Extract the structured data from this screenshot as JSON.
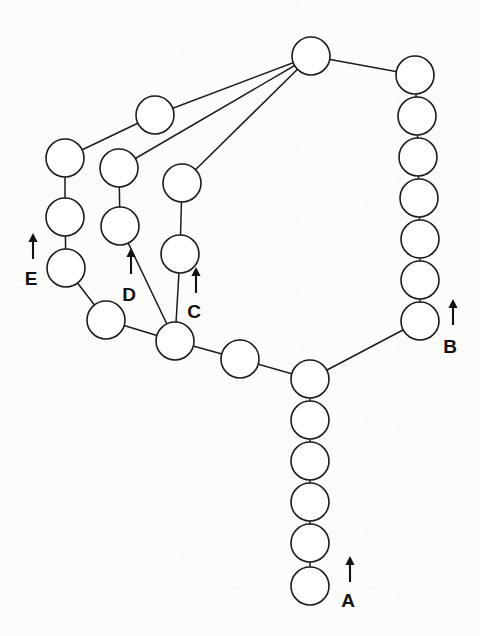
{
  "figure": {
    "canvas": {
      "width": 480,
      "height": 636
    },
    "background_color": "#fcfcfb",
    "stroke_color": "#1b1b1b",
    "node_fill_color": "#ffffff",
    "node_radius": 19
  },
  "nodes": [
    {
      "id": "n1",
      "name": "hub-top",
      "cx": 311,
      "cy": 56
    },
    {
      "id": "n2",
      "name": "right-chain-1",
      "cx": 415,
      "cy": 75
    },
    {
      "id": "n3",
      "name": "right-chain-2",
      "cx": 417,
      "cy": 116
    },
    {
      "id": "n4",
      "name": "right-chain-3",
      "cx": 418,
      "cy": 157
    },
    {
      "id": "n5",
      "name": "right-chain-4",
      "cx": 419,
      "cy": 198
    },
    {
      "id": "n6",
      "name": "right-chain-5",
      "cx": 420,
      "cy": 239
    },
    {
      "id": "n7",
      "name": "right-chain-6",
      "cx": 420,
      "cy": 280
    },
    {
      "id": "n8",
      "name": "right-chain-7-marker-b",
      "cx": 420,
      "cy": 321
    },
    {
      "id": "n9",
      "name": "upper-mid-node",
      "cx": 155,
      "cy": 115
    },
    {
      "id": "n10",
      "name": "e-chain-1",
      "cx": 65,
      "cy": 158
    },
    {
      "id": "n11",
      "name": "e-chain-2",
      "cx": 65,
      "cy": 217
    },
    {
      "id": "n12",
      "name": "e-chain-3-marker-e",
      "cx": 66,
      "cy": 268
    },
    {
      "id": "n13",
      "name": "d-chain-1",
      "cx": 119,
      "cy": 168
    },
    {
      "id": "n14",
      "name": "d-chain-2",
      "cx": 120,
      "cy": 226
    },
    {
      "id": "n15",
      "name": "c-chain-1",
      "cx": 182,
      "cy": 183
    },
    {
      "id": "n16",
      "name": "c-chain-2",
      "cx": 180,
      "cy": 254
    },
    {
      "id": "n17",
      "name": "left-junction",
      "cx": 106,
      "cy": 320
    },
    {
      "id": "n18",
      "name": "mid-junction-marker-cd",
      "cx": 175,
      "cy": 341
    },
    {
      "id": "n19",
      "name": "mid-link-node",
      "cx": 240,
      "cy": 359
    },
    {
      "id": "n20",
      "name": "main-junction",
      "cx": 310,
      "cy": 379
    },
    {
      "id": "n21",
      "name": "a-chain-1",
      "cx": 310,
      "cy": 420
    },
    {
      "id": "n22",
      "name": "a-chain-2",
      "cx": 310,
      "cy": 461
    },
    {
      "id": "n23",
      "name": "a-chain-3",
      "cx": 310,
      "cy": 502
    },
    {
      "id": "n24",
      "name": "a-chain-4",
      "cx": 310,
      "cy": 543
    },
    {
      "id": "n25",
      "name": "a-chain-5-marker-a",
      "cx": 310,
      "cy": 586
    }
  ],
  "edges": [
    {
      "from": "n1",
      "to": "n2",
      "name": "edge-hub-to-right-chain"
    },
    {
      "from": "n2",
      "to": "n3",
      "name": "edge-right-1-2"
    },
    {
      "from": "n3",
      "to": "n4",
      "name": "edge-right-2-3"
    },
    {
      "from": "n4",
      "to": "n5",
      "name": "edge-right-3-4"
    },
    {
      "from": "n5",
      "to": "n6",
      "name": "edge-right-4-5"
    },
    {
      "from": "n6",
      "to": "n7",
      "name": "edge-right-5-6"
    },
    {
      "from": "n7",
      "to": "n8",
      "name": "edge-right-6-7"
    },
    {
      "from": "n8",
      "to": "n20",
      "name": "edge-right-chain-to-main-junction"
    },
    {
      "from": "n1",
      "to": "n9",
      "name": "edge-hub-to-upper-mid"
    },
    {
      "from": "n9",
      "to": "n10",
      "name": "edge-upper-mid-to-e-chain"
    },
    {
      "from": "n1",
      "to": "n13",
      "name": "edge-hub-to-d-chain"
    },
    {
      "from": "n1",
      "to": "n15",
      "name": "edge-hub-to-c-chain"
    },
    {
      "from": "n10",
      "to": "n11",
      "name": "edge-e-1-2"
    },
    {
      "from": "n11",
      "to": "n12",
      "name": "edge-e-2-3"
    },
    {
      "from": "n12",
      "to": "n17",
      "name": "edge-e-chain-to-left-junction"
    },
    {
      "from": "n13",
      "to": "n14",
      "name": "edge-d-1-2"
    },
    {
      "from": "n14",
      "to": "n18",
      "name": "edge-d-chain-to-mid-junction"
    },
    {
      "from": "n15",
      "to": "n16",
      "name": "edge-c-1-2"
    },
    {
      "from": "n16",
      "to": "n18",
      "name": "edge-c-chain-to-mid-junction"
    },
    {
      "from": "n17",
      "to": "n18",
      "name": "edge-left-to-mid-junction"
    },
    {
      "from": "n18",
      "to": "n19",
      "name": "edge-mid-junction-to-link"
    },
    {
      "from": "n19",
      "to": "n20",
      "name": "edge-link-to-main-junction"
    },
    {
      "from": "n20",
      "to": "n21",
      "name": "edge-a-0-1"
    },
    {
      "from": "n21",
      "to": "n22",
      "name": "edge-a-1-2"
    },
    {
      "from": "n22",
      "to": "n23",
      "name": "edge-a-2-3"
    },
    {
      "from": "n23",
      "to": "n24",
      "name": "edge-a-3-4"
    },
    {
      "from": "n24",
      "to": "n25",
      "name": "edge-a-4-5"
    }
  ],
  "markers": [
    {
      "label": "A",
      "name": "marker-a",
      "label_x": 348,
      "label_y": 602,
      "arrow_x": 350,
      "arrow_tail_y": 582,
      "arrow_tip_y": 556
    },
    {
      "label": "B",
      "name": "marker-b",
      "label_x": 450,
      "label_y": 348,
      "arrow_x": 453,
      "arrow_tail_y": 325,
      "arrow_tip_y": 299
    },
    {
      "label": "C",
      "name": "marker-c",
      "label_x": 194,
      "label_y": 313,
      "arrow_x": 196,
      "arrow_tail_y": 293,
      "arrow_tip_y": 267
    },
    {
      "label": "D",
      "name": "marker-d",
      "label_x": 129,
      "label_y": 296,
      "arrow_x": 131,
      "arrow_tail_y": 274,
      "arrow_tip_y": 248
    },
    {
      "label": "E",
      "name": "marker-e",
      "label_x": 31,
      "label_y": 280,
      "arrow_x": 33,
      "arrow_tail_y": 259,
      "arrow_tip_y": 233
    }
  ]
}
